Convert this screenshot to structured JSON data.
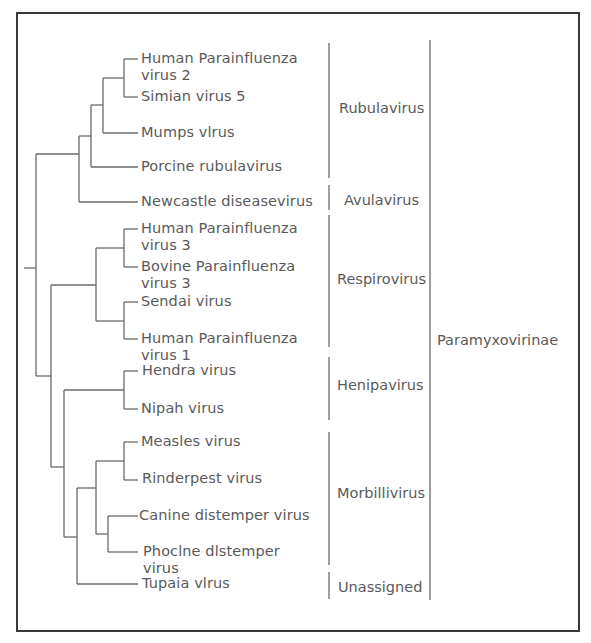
{
  "diagram": {
    "type": "phylogenetic-tree",
    "subfamily": "Paramyxovirinae",
    "taxa": [
      {
        "id": "hpiv2",
        "line1": "Human Parainfluenza",
        "line2": "virus 2"
      },
      {
        "id": "sv5",
        "line1": "Simian virus 5",
        "line2": ""
      },
      {
        "id": "mumps",
        "line1": "Mumps vlrus",
        "line2": ""
      },
      {
        "id": "porcine",
        "line1": "Porcine rubulavirus",
        "line2": ""
      },
      {
        "id": "ndv",
        "line1": "Newcastle diseasevirus",
        "line2": ""
      },
      {
        "id": "hpiv3",
        "line1": "Human Parainfluenza",
        "line2": "virus 3"
      },
      {
        "id": "bpiv3",
        "line1": "Bovine Parainfluenza",
        "line2": "virus 3"
      },
      {
        "id": "sendai",
        "line1": "Sendai virus",
        "line2": ""
      },
      {
        "id": "hpiv1",
        "line1": "Human Parainfluenza",
        "line2": "virus 1"
      },
      {
        "id": "hendra",
        "line1": "Hendra virus",
        "line2": ""
      },
      {
        "id": "nipah",
        "line1": "Nipah virus",
        "line2": ""
      },
      {
        "id": "measles",
        "line1": "Measles virus",
        "line2": ""
      },
      {
        "id": "rinderpest",
        "line1": "Rinderpest virus",
        "line2": ""
      },
      {
        "id": "cdv",
        "line1": "Canine distemper virus",
        "line2": ""
      },
      {
        "id": "pdv",
        "line1": "Phoclne dlstemper",
        "line2": "virus"
      },
      {
        "id": "tupaia",
        "line1": "Tupaia vlrus",
        "line2": ""
      }
    ],
    "genera": [
      {
        "name": "Rubulavirus",
        "members": [
          "hpiv2",
          "sv5",
          "mumps",
          "porcine"
        ]
      },
      {
        "name": "Avulavirus",
        "members": [
          "ndv"
        ]
      },
      {
        "name": "Respirovirus",
        "members": [
          "hpiv3",
          "bpiv3",
          "sendai",
          "hpiv1"
        ]
      },
      {
        "name": "Henipavirus",
        "members": [
          "hendra",
          "nipah"
        ]
      },
      {
        "name": "Morbillivirus",
        "members": [
          "measles",
          "rinderpest",
          "cdv",
          "pdv"
        ]
      },
      {
        "name": "Unassigned",
        "members": [
          "tupaia"
        ]
      }
    ],
    "topology": "((((((HPIV2,SV5),Mumps),Porcine),NDV),(((HPIV3,BPIV3),(Sendai,HPIV1)),((Hendra,Nipah),(((Measles,Rinderpest),(CDV,PDV)),Tupaia)))))",
    "colors": {
      "line": "#6a6a6a",
      "frame": "#3a3a3a",
      "text": "#5a5a5a"
    }
  }
}
